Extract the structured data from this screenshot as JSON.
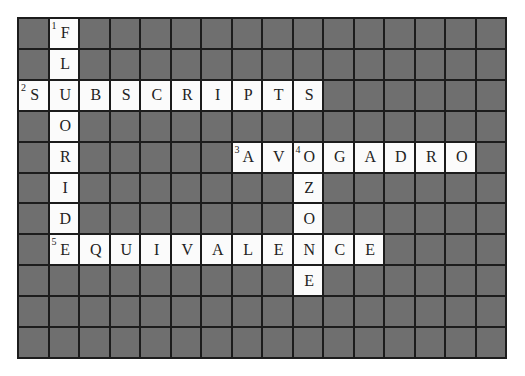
{
  "puzzle": {
    "cols": 16,
    "rows": 11,
    "colors": {
      "block": "#6f6f6f",
      "open": "#fbfbfb",
      "border": "#1c1c1c",
      "text": "#222222"
    },
    "entries": [
      {
        "number": "1",
        "direction": "down",
        "answer": "FLUORIDE",
        "row": 0,
        "col": 1
      },
      {
        "number": "2",
        "direction": "across",
        "answer": "SUBSCRIPTS",
        "row": 2,
        "col": 0
      },
      {
        "number": "3",
        "direction": "across",
        "answer": "AVOGADRO",
        "row": 4,
        "col": 7
      },
      {
        "number": "4",
        "direction": "down",
        "answer": "OZONE",
        "row": 4,
        "col": 9
      },
      {
        "number": "5",
        "direction": "across",
        "answer": "EQUIVALENCE",
        "row": 7,
        "col": 1
      }
    ]
  }
}
